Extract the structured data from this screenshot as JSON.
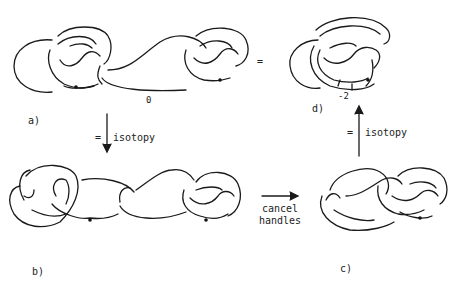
{
  "panels": {
    "a": {
      "label": "a)",
      "framing": "0"
    },
    "b": {
      "label": "b)"
    },
    "c": {
      "label": "c)"
    },
    "d": {
      "label": "d)",
      "framing": "-2"
    }
  },
  "arrows": {
    "a_to_b": {
      "eq": "=",
      "text": "isotopy",
      "direction": "down"
    },
    "b_to_c": {
      "text_line1": "cancel",
      "text_line2": "handles",
      "direction": "right"
    },
    "c_to_d": {
      "eq": "=",
      "text": "isotopy",
      "direction": "up"
    }
  },
  "equals_ad": "="
}
